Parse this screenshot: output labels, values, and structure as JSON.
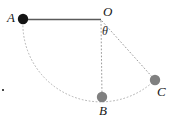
{
  "figure": {
    "kind": "pendulum-swing-diagram",
    "width": 178,
    "height": 123,
    "background_color": "#ffffff"
  },
  "labels": {
    "A": "A",
    "O": "O",
    "B": "B",
    "C": "C",
    "theta": "θ"
  },
  "geometry": {
    "pivot": {
      "name": "O",
      "x": 101,
      "y": 20
    },
    "radius": 78,
    "bobs": [
      {
        "name": "A",
        "x": 23,
        "y": 19,
        "r": 5.2,
        "color": "#141414",
        "style": "filled-black"
      },
      {
        "name": "B",
        "x": 102,
        "y": 97,
        "r": 5.2,
        "color": "#808080",
        "style": "filled-gray"
      },
      {
        "name": "C",
        "x": 155,
        "y": 80,
        "r": 5.2,
        "color": "#808080",
        "style": "filled-gray"
      }
    ],
    "rods": [
      {
        "from": "O",
        "to": "A",
        "style": "solid",
        "color": "#5a5a5a",
        "width": 1.6
      },
      {
        "from": "O",
        "to": "B",
        "style": "dotted",
        "color": "#9a9a9a",
        "width": 1.0
      },
      {
        "from": "O",
        "to": "C",
        "style": "dotted",
        "color": "#9a9a9a",
        "width": 1.0
      }
    ],
    "arc": {
      "from": "A",
      "to": "C",
      "through": "B",
      "style": "dotted",
      "color": "#b0b0b0",
      "width": 1.0
    },
    "angle_arc": {
      "label": "θ",
      "between": [
        "O-B",
        "O-C"
      ],
      "vertex": "O"
    }
  },
  "colors": {
    "solid_rod": "#5a5a5a",
    "dotted_rod": "#9a9a9a",
    "dotted_arc": "#b0b0b0",
    "bob_black": "#141414",
    "bob_gray": "#808080",
    "text": "#171717"
  }
}
